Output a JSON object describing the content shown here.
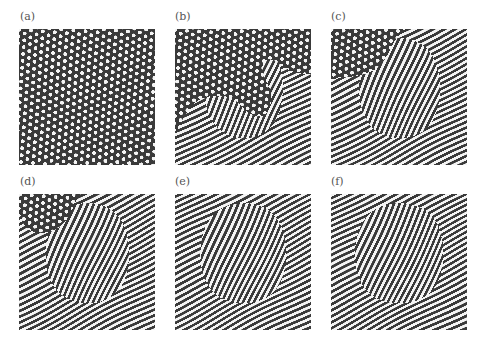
{
  "figure": {
    "colors": {
      "dark": "#3a3a3a",
      "light": "#f4f4f4",
      "label": "#555555",
      "background": "#ffffff"
    },
    "panels": [
      {
        "label": "(a)",
        "state": "hexagons",
        "stripe_fraction": 0.0,
        "hex_fraction": 1.0
      },
      {
        "label": "(b)",
        "state": "hexagons+stripes",
        "stripe_fraction": 0.45,
        "hex_fraction": 0.55
      },
      {
        "label": "(c)",
        "state": "mostly-stripes",
        "stripe_fraction": 0.85,
        "hex_fraction": 0.15
      },
      {
        "label": "(d)",
        "state": "stripes-defects",
        "stripe_fraction": 0.98,
        "hex_fraction": 0.02
      },
      {
        "label": "(e)",
        "state": "stripes",
        "stripe_fraction": 1.0,
        "hex_fraction": 0.0
      },
      {
        "label": "(f)",
        "state": "stripes",
        "stripe_fraction": 1.0,
        "hex_fraction": 0.0
      }
    ]
  }
}
